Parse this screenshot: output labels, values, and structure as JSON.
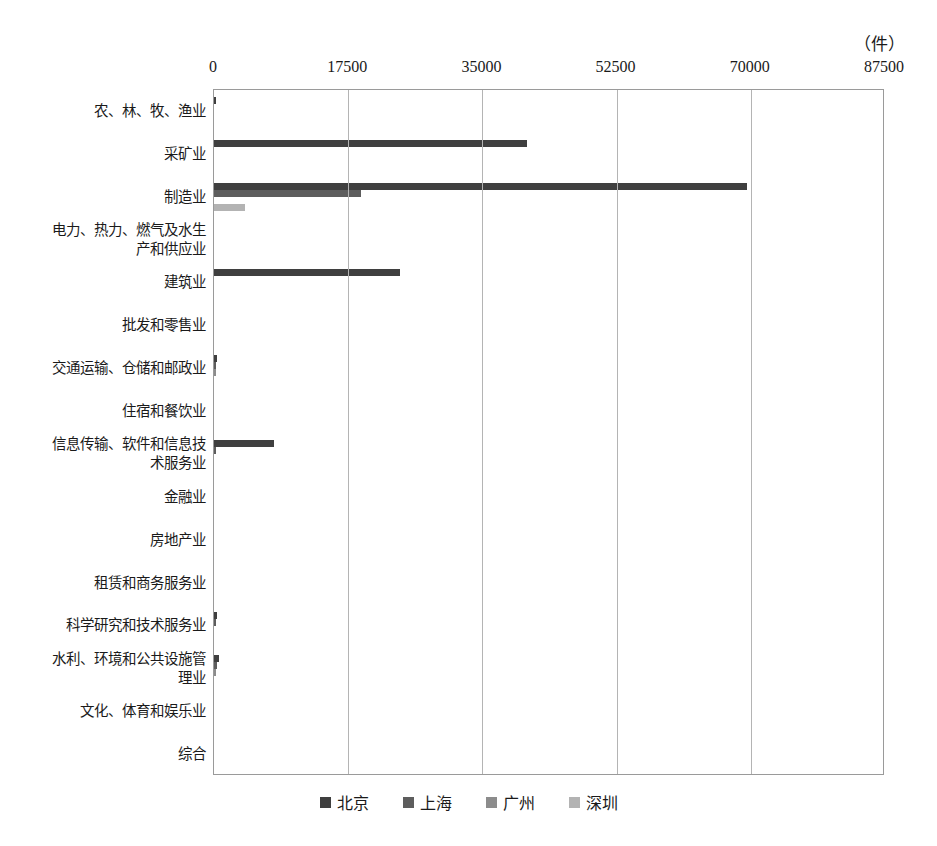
{
  "chart_data": {
    "type": "bar",
    "orientation": "horizontal",
    "title": "",
    "xlabel": "",
    "ylabel": "",
    "unit_label": "（件）",
    "xlim": [
      0,
      87500
    ],
    "xticks": [
      0,
      17500,
      35000,
      52500,
      70000,
      87500
    ],
    "xtick_labels": [
      "0",
      "17500",
      "35000",
      "52500",
      "70000",
      "87500"
    ],
    "grid": true,
    "legend_position": "bottom",
    "categories": [
      "农、林、牧、渔业",
      "采矿业",
      "制造业",
      "电力、热力、燃气及水生\n产和供应业",
      "建筑业",
      "批发和零售业",
      "交通运输、仓储和邮政业",
      "住宿和餐饮业",
      "信息传输、软件和信息技\n术服务业",
      "金融业",
      "房地产业",
      "租赁和商务服务业",
      "科学研究和技术服务业",
      "水利、环境和公共设施管\n理业",
      "文化、体育和娱乐业",
      "综合"
    ],
    "series": [
      {
        "name": "北京",
        "color": "#3f3f3f",
        "values": [
          150,
          40800,
          69500,
          0,
          24200,
          0,
          400,
          0,
          7800,
          0,
          0,
          0,
          350,
          700,
          0,
          0
        ]
      },
      {
        "name": "上海",
        "color": "#5d5d5d",
        "values": [
          0,
          0,
          19200,
          0,
          0,
          0,
          250,
          0,
          250,
          0,
          0,
          0,
          200,
          450,
          0,
          0
        ]
      },
      {
        "name": "广州",
        "color": "#8c8c8c",
        "values": [
          0,
          0,
          0,
          0,
          0,
          0,
          150,
          0,
          0,
          0,
          0,
          0,
          0,
          250,
          0,
          0
        ]
      },
      {
        "name": "深圳",
        "color": "#b3b3b3",
        "values": [
          0,
          0,
          4100,
          0,
          0,
          0,
          0,
          0,
          0,
          0,
          0,
          0,
          0,
          0,
          0,
          0
        ]
      }
    ]
  }
}
